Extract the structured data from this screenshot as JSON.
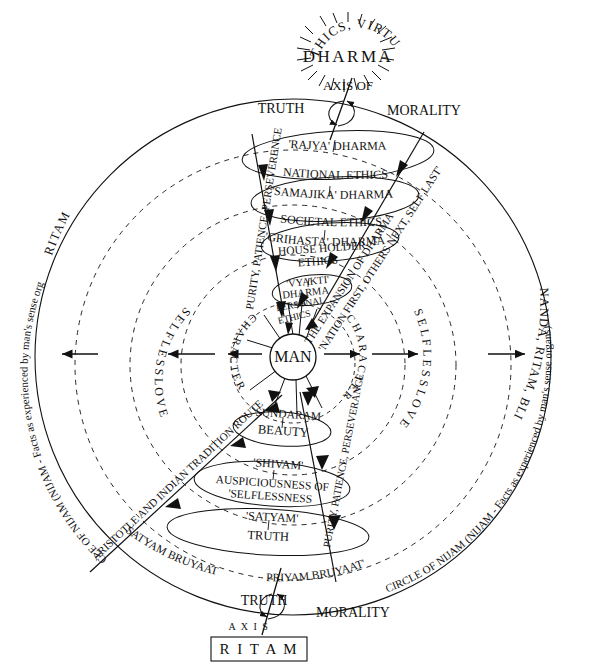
{
  "diagram": {
    "title": "DHARMA",
    "subtitle": "ETHICS, VIRTUE",
    "center_label": "MAN",
    "top_axis": {
      "axis_of": "AXIS OF",
      "left": "TRUTH",
      "right": "MORALITY"
    },
    "bottom_axis": {
      "axis_of": "A X I S",
      "left": "TRUTH",
      "right": "MORALITY",
      "boxed_label": "R I T A M"
    },
    "outer_arc_left": "RITAM",
    "outer_arc_left_long": "CIRCLE OF NIJAM (NIJAM - Facts as experienced by man's sense organs)",
    "outer_arc_right": "ANANDA, RITAM, BLISS",
    "outer_arc_right_long": "CIRCLE OF NIJAM (NIJAM - Facts as experienced by man's sense organs)",
    "inner_dashed_rings": [
      {
        "label": "S E L F L E S S   L O V E",
        "name": "selfless-love-ring"
      },
      {
        "label": "C H A R A C T E R",
        "name": "character-ring"
      }
    ],
    "ring_labels": {
      "selfless_love": "S E L F L E S S   L O V E",
      "character": "C H A R A C T E R"
    },
    "upper_ellipses": [
      {
        "sanskrit": "'RAJYA' DHARMA",
        "english": "NATIONAL ETHICS"
      },
      {
        "sanskrit": "'SAMAJIKA' DHARMA",
        "english": "SOCIETAL ETHICS"
      },
      {
        "sanskrit": "'GRIHASTA' DHARMA",
        "english": "HOUSE HOLDER ETHICS"
      },
      {
        "sanskrit": "'VYAKTI' DHARMA",
        "english": "PERSONAL ETHICS"
      }
    ],
    "lower_ellipses": [
      {
        "sanskrit": "SUNDARAM",
        "english": "BEAUTY"
      },
      {
        "sanskrit": "'SHIVAM'",
        "english": "AUSPICIOUSNESS OF 'SELFLESSNESS"
      },
      {
        "sanskrit": "'SATYAM'",
        "english": "TRUTH"
      }
    ],
    "diagonal_labels": {
      "upper_left": "PURITY, PATIENCE, PERSEVERENCE",
      "upper_right_line1": "THE EXPANSION OF DHARMA",
      "upper_right_line2": "'NATION FIRST, OTHERS NEXT, SELF LAST'",
      "lower_left": "ARISTOTLE AND INDIAN TRADITION ROUTE",
      "lower_right": "PURITY, PATIENCE, PERSEVERANCE"
    },
    "bottom_arc_left": "SATYAM BRUYAAT",
    "bottom_arc_right": "PRIYAM BRUYAAT'",
    "colors": {
      "ink": "#111111",
      "background": "#ffffff"
    }
  }
}
